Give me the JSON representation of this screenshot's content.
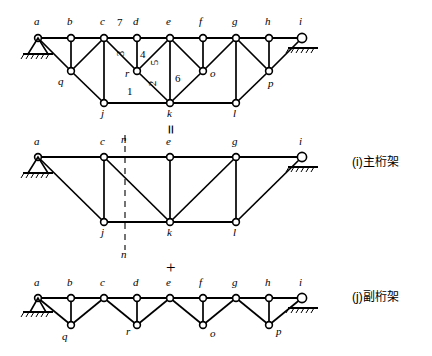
{
  "figure": {
    "type": "structural-truss-decomposition",
    "operators": {
      "equals": "=",
      "plus": "+"
    },
    "captions": [
      {
        "id": "i",
        "text": "(i)主桁架",
        "meaning": "main truss"
      },
      {
        "id": "j",
        "text": "(j)副桁架",
        "meaning": "secondary truss"
      }
    ]
  },
  "panels": [
    {
      "key": "compound",
      "name": "compound-truss",
      "node_labels": [
        "a",
        "b",
        "c",
        "d",
        "e",
        "f",
        "g",
        "h",
        "i",
        "q",
        "r",
        "o",
        "p",
        "j",
        "k",
        "l"
      ],
      "member_numbers": [
        "1",
        "2",
        "3",
        "4",
        "5",
        "6",
        "7"
      ],
      "supports": [
        {
          "node": "a",
          "type": "pinned"
        },
        {
          "node": "i",
          "type": "roller"
        }
      ]
    },
    {
      "key": "main",
      "name": "main-truss",
      "node_labels": [
        "a",
        "c",
        "e",
        "g",
        "i",
        "j",
        "k",
        "l"
      ],
      "section_labels": [
        "n",
        "n"
      ],
      "supports": [
        {
          "node": "a",
          "type": "pinned"
        },
        {
          "node": "i",
          "type": "roller"
        }
      ]
    },
    {
      "key": "secondary",
      "name": "secondary-truss",
      "node_labels": [
        "a",
        "b",
        "c",
        "d",
        "e",
        "f",
        "g",
        "h",
        "i",
        "q",
        "r",
        "o",
        "p"
      ],
      "supports": [
        {
          "node": "a",
          "type": "pinned"
        },
        {
          "node": "i",
          "type": "roller"
        }
      ]
    }
  ],
  "colors": {
    "line": "#000000",
    "node_fill": "#ffffff",
    "background": "#ffffff"
  }
}
